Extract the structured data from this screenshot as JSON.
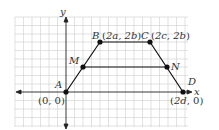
{
  "figure": {
    "type": "coordinate-diagram",
    "axes": {
      "x_label": "x",
      "y_label": "y"
    },
    "points": [
      {
        "name": "A",
        "coord_label": "(0, 0)"
      },
      {
        "name": "B",
        "coord_label": "(2a, 2b)"
      },
      {
        "name": "C",
        "coord_label": "(2c, 2b)"
      },
      {
        "name": "D",
        "coord_label": "(2d, 0)"
      },
      {
        "name": "M",
        "coord_label": ""
      },
      {
        "name": "N",
        "coord_label": ""
      }
    ],
    "segments": [
      "AB",
      "BC",
      "CD",
      "DA",
      "MN"
    ]
  }
}
